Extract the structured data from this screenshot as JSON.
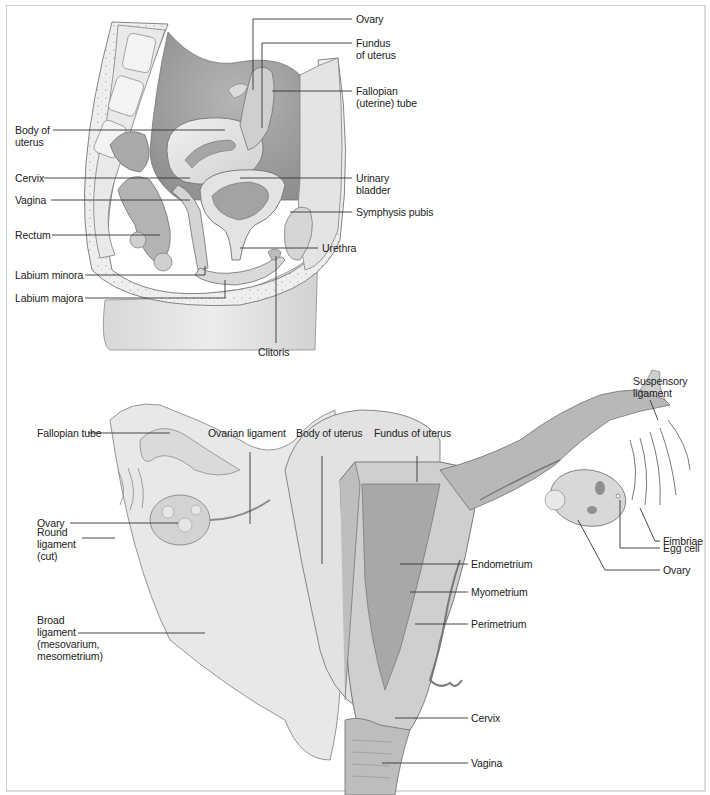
{
  "figure": {
    "top_panel": {
      "name": "Sagittal section of female pelvis",
      "labels": {
        "ovary": "Ovary",
        "fundus_of_uterus": "Fundus\nof uterus",
        "fallopian_tube": "Fallopian\n(uterine) tube",
        "body_of_uterus": "Body of\nuterus",
        "cervix": "Cervix",
        "urinary_bladder": "Urinary\nbladder",
        "vagina": "Vagina",
        "symphysis_pubis": "Symphysis pubis",
        "rectum": "Rectum",
        "urethra": "Urethra",
        "labium_minora": "Labium minora",
        "labium_majora": "Labium majora",
        "clitoris": "Clitoris"
      }
    },
    "bottom_panel": {
      "name": "Posterior view of uterus, tubes and ovaries",
      "labels": {
        "suspensory_ligament": "Suspensory\nligament",
        "fallopian_tube": "Fallopian tube",
        "ovarian_ligament": "Ovarian ligament",
        "body_of_uterus": "Body of uterus",
        "fundus_of_uterus": "Fundus of uterus",
        "ovary_left": "Ovary",
        "fimbriae": "Fimbriae",
        "round_ligament": "Round\nligament\n(cut)",
        "egg_cell": "Egg cell",
        "ovary_right": "Ovary",
        "endometrium": "Endometrium",
        "myometrium": "Myometrium",
        "broad_ligament": "Broad\nligament\n(mesovarium,\nmesometrium)",
        "perimetrium": "Perimetrium",
        "cervix": "Cervix",
        "vagina": "Vagina"
      }
    },
    "colors": {
      "tissue_light": "#e6e6e6",
      "tissue_mid": "#c9c9c9",
      "tissue_dark": "#9a9a9a",
      "outline": "#6f6f6f",
      "leader_line": "#333333"
    }
  }
}
